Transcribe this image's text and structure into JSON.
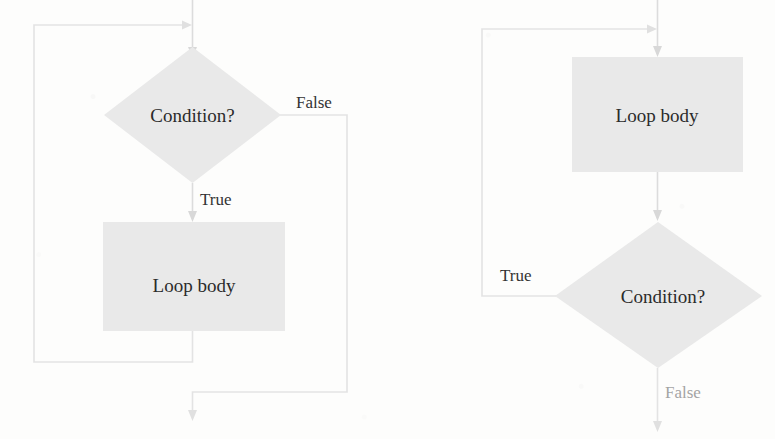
{
  "figure": {
    "background_color": "#fdfdfc",
    "shape_fill_color": "#e9e9e9",
    "connector_color": "#dcdcdc",
    "text_color": "#2b2b2b"
  },
  "diagrams": [
    {
      "id": "while-loop",
      "name": "pre-test-loop",
      "nodes": [
        {
          "id": "condition",
          "shape": "diamond",
          "label": "Condition?"
        },
        {
          "id": "body",
          "shape": "rectangle",
          "label": "Loop body"
        }
      ],
      "edges": [
        {
          "id": "entry",
          "from": "entry-point",
          "to": "condition",
          "label": ""
        },
        {
          "id": "true",
          "from": "condition",
          "to": "body",
          "label": "True"
        },
        {
          "id": "false",
          "from": "condition",
          "to": "exit-point",
          "label": "False"
        },
        {
          "id": "loopback",
          "from": "body",
          "to": "condition",
          "label": ""
        }
      ]
    },
    {
      "id": "do-while-loop",
      "name": "post-test-loop",
      "nodes": [
        {
          "id": "body",
          "shape": "rectangle",
          "label": "Loop body"
        },
        {
          "id": "condition",
          "shape": "diamond",
          "label": "Condition?"
        }
      ],
      "edges": [
        {
          "id": "entry",
          "from": "entry-point",
          "to": "body",
          "label": ""
        },
        {
          "id": "body-to-condition",
          "from": "body",
          "to": "condition",
          "label": ""
        },
        {
          "id": "true",
          "from": "condition",
          "to": "body",
          "label": "True"
        },
        {
          "id": "false",
          "from": "condition",
          "to": "exit-point",
          "label": "False"
        }
      ]
    }
  ],
  "labels": {
    "condition_left": "Condition?",
    "loop_body_left": "Loop body",
    "true_left": "True",
    "false_left": "False",
    "loop_body_right": "Loop body",
    "condition_right": "Condition?",
    "true_right": "True",
    "false_right": "False"
  }
}
